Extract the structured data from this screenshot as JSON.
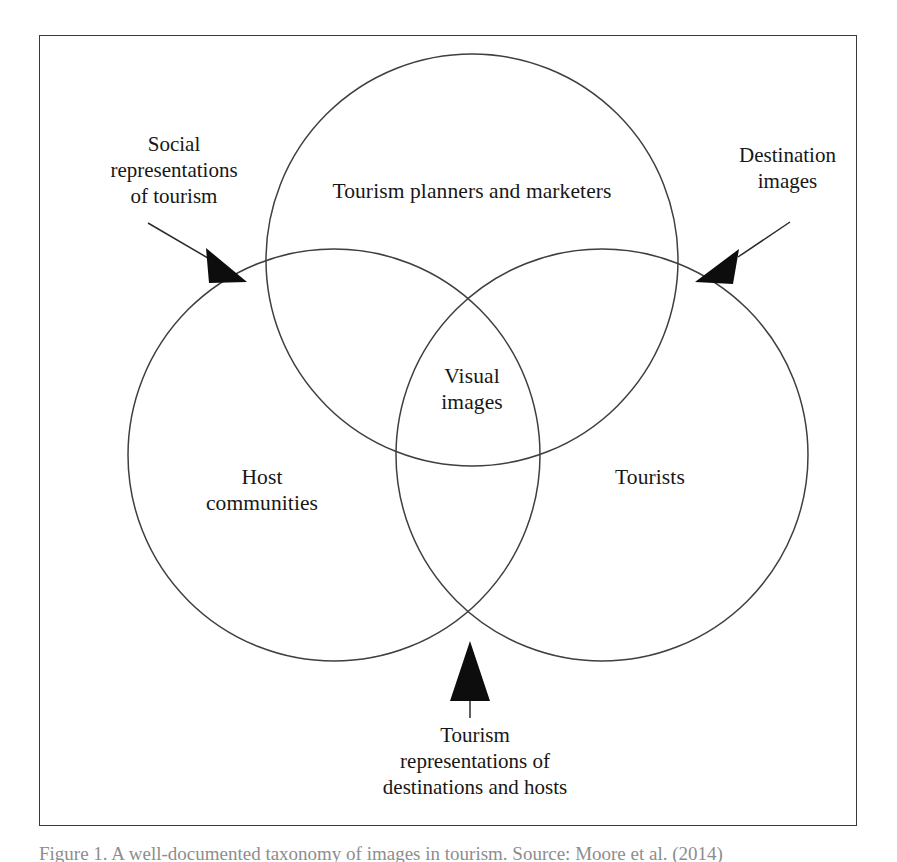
{
  "figure": {
    "type": "venn-diagram",
    "set_count": 3,
    "frame": {
      "border_color": "#3a3a3a"
    },
    "circle_stroke_color": "#3f3f3f",
    "arrow_color": "#0d0d0d"
  },
  "circles": {
    "top": {
      "label": "Tourism planners and marketers"
    },
    "left": {
      "label": "Host\ncommunities"
    },
    "right": {
      "label": "Tourists"
    }
  },
  "intersections": {
    "center_all_three": {
      "label": "Visual\nimages"
    },
    "top_left": {
      "label": "Social\nrepresentations\nof tourism"
    },
    "top_right": {
      "label": "Destination\nimages"
    },
    "left_right": {
      "label": "Tourism\nrepresentations of\ndestinations and hosts"
    }
  },
  "caption": {
    "text": "Figure 1. A well-documented taxonomy of images in tourism. Source: Moore et al. (2014)"
  }
}
